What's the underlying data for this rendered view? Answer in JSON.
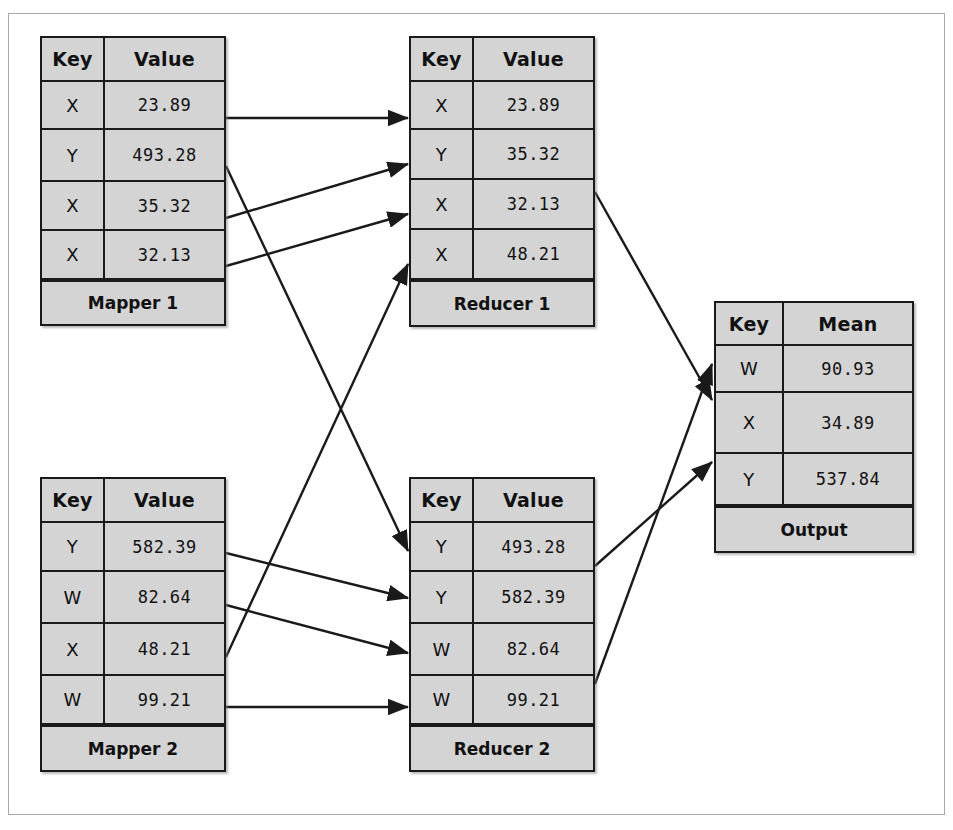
{
  "diagram": {
    "background": "#ffffff",
    "box_fill": "#d4d4d4",
    "line_color": "#1a1a1a",
    "frame_color": "#a8a8a8"
  },
  "tables": {
    "mapper1": {
      "name": "Mapper 1",
      "headers": [
        "Key",
        "Value"
      ],
      "rows": [
        {
          "key": "X",
          "value": "23.89"
        },
        {
          "key": "Y",
          "value": "493.28"
        },
        {
          "key": "X",
          "value": "35.32"
        },
        {
          "key": "X",
          "value": "32.13"
        }
      ],
      "footer": "Mapper 1"
    },
    "mapper2": {
      "name": "Mapper 2",
      "headers": [
        "Key",
        "Value"
      ],
      "rows": [
        {
          "key": "Y",
          "value": "582.39"
        },
        {
          "key": "W",
          "value": "82.64"
        },
        {
          "key": "X",
          "value": "48.21"
        },
        {
          "key": "W",
          "value": "99.21"
        }
      ],
      "footer": "Mapper 2"
    },
    "reducer1": {
      "name": "Reducer 1",
      "headers": [
        "Key",
        "Value"
      ],
      "rows": [
        {
          "key": "X",
          "value": "23.89"
        },
        {
          "key": "Y",
          "value": "35.32"
        },
        {
          "key": "X",
          "value": "32.13"
        },
        {
          "key": "X",
          "value": "48.21"
        }
      ],
      "footer": "Reducer 1"
    },
    "reducer2": {
      "name": "Reducer 2",
      "headers": [
        "Key",
        "Value"
      ],
      "rows": [
        {
          "key": "Y",
          "value": "493.28"
        },
        {
          "key": "Y",
          "value": "582.39"
        },
        {
          "key": "W",
          "value": "82.64"
        },
        {
          "key": "W",
          "value": "99.21"
        }
      ],
      "footer": "Reducer 2"
    },
    "output": {
      "name": "Output",
      "headers": [
        "Key",
        "Mean"
      ],
      "rows": [
        {
          "key": "W",
          "value": "90.93"
        },
        {
          "key": "X",
          "value": "34.89"
        },
        {
          "key": "Y",
          "value": "537.84"
        }
      ],
      "footer": "Output"
    }
  },
  "edges": [
    {
      "id": "m1r1-to-red1r1",
      "from": "mapper1.row1",
      "to": "reducer1.row1",
      "x1": 226,
      "y1": 118,
      "x2": 408,
      "y2": 118
    },
    {
      "id": "m1r2-to-red2r1",
      "from": "mapper1.row2",
      "to": "reducer2.row1",
      "x1": 226,
      "y1": 166,
      "x2": 408,
      "y2": 551
    },
    {
      "id": "m1r3-to-red1r2",
      "from": "mapper1.row3",
      "to": "reducer1.row2",
      "x1": 226,
      "y1": 218,
      "x2": 408,
      "y2": 164
    },
    {
      "id": "m1r4-to-red1r3",
      "from": "mapper1.row4",
      "to": "reducer1.row3",
      "x1": 226,
      "y1": 266,
      "x2": 408,
      "y2": 214
    },
    {
      "id": "m2r1-to-red2r2",
      "from": "mapper2.row1",
      "to": "reducer2.row2",
      "x1": 226,
      "y1": 553,
      "x2": 408,
      "y2": 598
    },
    {
      "id": "m2r2-to-red2r3",
      "from": "mapper2.row2",
      "to": "reducer2.row3",
      "x1": 226,
      "y1": 605,
      "x2": 408,
      "y2": 653
    },
    {
      "id": "m2r3-to-red1r4",
      "from": "mapper2.row3",
      "to": "reducer1.row4",
      "x1": 226,
      "y1": 657,
      "x2": 408,
      "y2": 264
    },
    {
      "id": "m2r4-to-red2r4",
      "from": "mapper2.row4",
      "to": "reducer2.row4",
      "x1": 226,
      "y1": 707,
      "x2": 408,
      "y2": 707
    },
    {
      "id": "red1-to-output-x",
      "from": "reducer1",
      "to": "output.row_x",
      "x1": 595,
      "y1": 192,
      "x2": 712,
      "y2": 400
    },
    {
      "id": "red2-to-output-y",
      "from": "reducer2",
      "to": "output.row_y",
      "x1": 595,
      "y1": 566,
      "x2": 712,
      "y2": 462
    },
    {
      "id": "red2-to-output-w",
      "from": "reducer2",
      "to": "output.row_w",
      "x1": 595,
      "y1": 684,
      "x2": 712,
      "y2": 364
    }
  ]
}
